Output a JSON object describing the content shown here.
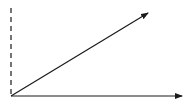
{
  "diagram": {
    "stroke_color": "#1a1a1a",
    "background": "#ffffff",
    "origin": {
      "x": 11,
      "y": 96
    },
    "vertical_dashed_axis": {
      "x": 11,
      "y_top": 8,
      "y_bottom": 96,
      "style": "dashed"
    },
    "horizontal_axis_arrow": {
      "x1": 11,
      "y1": 96,
      "x2": 182,
      "y2": 96,
      "style": "solid",
      "arrowhead": true
    },
    "diagonal_vector_arrow": {
      "x1": 11,
      "y1": 96,
      "x2": 148,
      "y2": 13,
      "style": "solid",
      "arrowhead": true
    }
  }
}
